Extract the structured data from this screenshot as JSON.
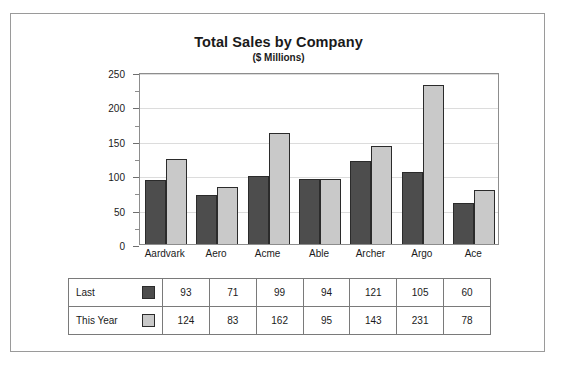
{
  "chart_data": {
    "type": "bar",
    "title": "Total Sales by Company",
    "subtitle": "($ Millions)",
    "xlabel": "",
    "ylabel": "",
    "ylim": [
      0,
      250
    ],
    "yticks": [
      0,
      50,
      100,
      150,
      200,
      250
    ],
    "grid": true,
    "legend_position": "table",
    "categories": [
      "Aardvark",
      "Aero",
      "Acme",
      "Able",
      "Archer",
      "Argo",
      "Ace"
    ],
    "series": [
      {
        "name": "Last",
        "color": "#4d4d4d",
        "values": [
          93,
          71,
          99,
          94,
          121,
          105,
          60
        ]
      },
      {
        "name": "This Year",
        "color": "#c9c9c9",
        "values": [
          124,
          83,
          162,
          95,
          143,
          231,
          78
        ]
      }
    ]
  },
  "table": {
    "rows": [
      {
        "label": "Last",
        "swatch": "swatch-dark-gray",
        "values": [
          "93",
          "71",
          "99",
          "94",
          "121",
          "105",
          "60"
        ]
      },
      {
        "label": "This Year",
        "swatch": "swatch-light-gray",
        "values": [
          "124",
          "83",
          "162",
          "95",
          "143",
          "231",
          "78"
        ]
      }
    ]
  }
}
